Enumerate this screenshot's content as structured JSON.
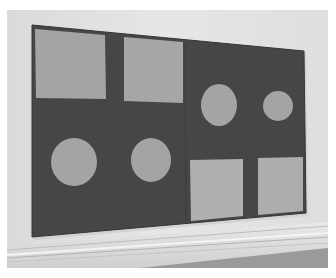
{
  "image": {
    "description": "Photograph of a large geometric painting hanging on a gallery wall above a white baseboard molding",
    "colors": {
      "border": "#ffffff",
      "wall": "#e4e4e4",
      "wall_shadow": "#d2d2d2",
      "canvas": "#464646",
      "canvas_edge": "#3a3a3a",
      "shape_fill": "#a4a4a4",
      "shape_fill_light": "#b0b0b0",
      "baseboard": "#dcdcdc",
      "baseboard_line": "#b8b8b8",
      "floor": "#8a8a8a"
    },
    "painting": {
      "panels": 2,
      "shapes": [
        {
          "type": "square",
          "panel": "left",
          "position": "top-left"
        },
        {
          "type": "square",
          "panel": "left",
          "position": "top-right"
        },
        {
          "type": "circle",
          "panel": "left",
          "position": "bottom-left"
        },
        {
          "type": "circle",
          "panel": "left",
          "position": "bottom-right"
        },
        {
          "type": "circle",
          "panel": "right",
          "position": "top-left"
        },
        {
          "type": "circle",
          "panel": "right",
          "position": "top-right"
        },
        {
          "type": "square",
          "panel": "right",
          "position": "bottom-left"
        },
        {
          "type": "square",
          "panel": "right",
          "position": "bottom-right"
        }
      ]
    }
  }
}
